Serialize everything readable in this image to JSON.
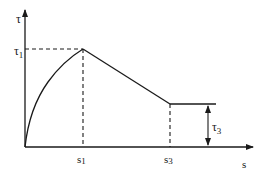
{
  "diagram": {
    "type": "bond-slip curve",
    "axes": {
      "y_label": "τ",
      "x_label": "s"
    },
    "labels": {
      "tau1": "τ",
      "tau1_sub": "1",
      "tau3": "τ",
      "tau3_sub": "3",
      "s1": "s",
      "s1_sub": "1",
      "s3": "s",
      "s3_sub": "3"
    },
    "points": [
      {
        "name": "origin",
        "s": 0,
        "tau": 0
      },
      {
        "name": "peak",
        "s": "s1",
        "tau": "τ1"
      },
      {
        "name": "residual-start",
        "s": "s3",
        "tau": "τ3"
      }
    ],
    "colors": {
      "line": "#1a1a1a",
      "background": "#ffffff"
    }
  }
}
